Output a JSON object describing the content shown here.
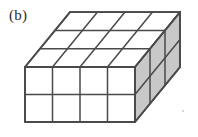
{
  "figure": {
    "panel_label": "(b)",
    "caption_visible": false,
    "background_color": "#ffffff"
  },
  "geometry": {
    "units_wide": 4,
    "units_tall": 2,
    "units_deep": 3,
    "total_cubes": 24,
    "front_face": {
      "columns": 4,
      "rows": 2,
      "fill": "#ffffff",
      "label": "front-face"
    },
    "top_face": {
      "columns": 4,
      "rows": 3,
      "fill": "#ffffff",
      "label": "top-face"
    },
    "right_face": {
      "columns": 3,
      "rows": 2,
      "fill": "#c8c8c8",
      "label": "right-face"
    },
    "edge_color": "#4a4a4a",
    "edge_width": 1.6,
    "projection": {
      "front_origin_x": 25,
      "front_origin_y": 67,
      "cell_width": 27.5,
      "cell_height": 27.5,
      "depth_dx": 15,
      "depth_dy": -18.3
    }
  },
  "artifacts": {
    "speck": {
      "x": 182,
      "y": 110,
      "color": "#c9c9c9"
    }
  }
}
